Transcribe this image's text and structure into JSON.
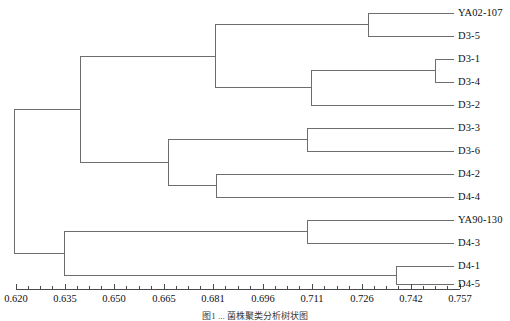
{
  "figure": {
    "type": "dendrogram",
    "caption": "图1 ... 菌株聚类分析树状图",
    "line_color": "#6d6d6d",
    "text_color": "#111111",
    "background": "#ffffff"
  },
  "axis": {
    "orientation": "horizontal",
    "label": "",
    "range": [
      0.62,
      0.757
    ],
    "pixel_range": [
      16,
      460
    ],
    "tick_labels": [
      "0.620",
      "0.635",
      "0.650",
      "0.665",
      "0.681",
      "0.696",
      "0.711",
      "0.726",
      "0.742",
      "0.757"
    ],
    "tick_values": [
      0.62,
      0.635,
      0.65,
      0.665,
      0.681,
      0.696,
      0.711,
      0.726,
      0.742,
      0.757
    ],
    "tick_x": [
      16,
      65,
      114,
      164,
      213,
      263,
      312,
      362,
      411,
      460
    ],
    "minor_ticks_between": 3,
    "baseline_y": 289
  },
  "leaves": [
    {
      "id": "YA02-107",
      "label": "YA02-107",
      "y": 13,
      "tip_x": 454
    },
    {
      "id": "D3-5",
      "label": "D3-5",
      "y": 36,
      "tip_x": 454
    },
    {
      "id": "D3-1",
      "label": "D3-1",
      "y": 59,
      "tip_x": 454
    },
    {
      "id": "D3-4",
      "label": "D3-4",
      "y": 82,
      "tip_x": 454
    },
    {
      "id": "D3-2",
      "label": "D3-2",
      "y": 105,
      "tip_x": 454
    },
    {
      "id": "D3-3",
      "label": "D3-3",
      "y": 128,
      "tip_x": 454
    },
    {
      "id": "D3-6",
      "label": "D3-6",
      "y": 151,
      "tip_x": 454
    },
    {
      "id": "D4-2",
      "label": "D4-2",
      "y": 174,
      "tip_x": 454
    },
    {
      "id": "D4-4",
      "label": "D4-4",
      "y": 197,
      "tip_x": 454
    },
    {
      "id": "YA90-130",
      "label": "YA90-130",
      "y": 220,
      "tip_x": 454
    },
    {
      "id": "D4-3",
      "label": "D4-3",
      "y": 243,
      "tip_x": 454
    },
    {
      "id": "D4-1",
      "label": "D4-1",
      "y": 266,
      "tip_x": 454
    },
    {
      "id": "D4-5",
      "label": "D4-5",
      "y": 284,
      "tip_x": 454
    }
  ],
  "nodes": [
    {
      "id": "n1",
      "name": "YA02-107 + D3-5",
      "x": 368,
      "y1": 13,
      "y2": 36,
      "y": 24.5
    },
    {
      "id": "n2",
      "name": "D3-1 + D3-4",
      "x": 435,
      "y1": 59,
      "y2": 82,
      "y": 70.5
    },
    {
      "id": "n3",
      "name": "(D3-1,D3-4) + D3-2",
      "x": 311,
      "y1": 70.5,
      "y2": 105,
      "y": 87.75
    },
    {
      "id": "n4",
      "name": "top cluster",
      "x": 215,
      "y1": 24.5,
      "y2": 87.75,
      "y": 56.1
    },
    {
      "id": "n5",
      "name": "D3-3 + D3-6",
      "x": 307,
      "y1": 128,
      "y2": 151,
      "y": 139.5
    },
    {
      "id": "n6",
      "name": "D4-2 + D4-4",
      "x": 216,
      "y1": 174,
      "y2": 197,
      "y": 185.5
    },
    {
      "id": "n7",
      "name": "(D3-3,D3-6) + (D4-2,D4-4)",
      "x": 168,
      "y1": 139.5,
      "y2": 185.5,
      "y": 162.5
    },
    {
      "id": "n8",
      "name": "upper clade",
      "x": 80,
      "y1": 56.1,
      "y2": 162.5,
      "y": 109.3
    },
    {
      "id": "n9",
      "name": "YA90-130 + D4-3",
      "x": 307,
      "y1": 220,
      "y2": 243,
      "y": 231.5
    },
    {
      "id": "n10",
      "name": "D4-1 + D4-5",
      "x": 396,
      "y1": 266,
      "y2": 284,
      "y": 275
    },
    {
      "id": "n11",
      "name": "lower clade",
      "x": 64,
      "y1": 231.5,
      "y2": 275,
      "y": 253.25
    },
    {
      "id": "n12",
      "name": "root",
      "x": 14,
      "y1": 109.3,
      "y2": 253.25,
      "y": 181.3
    }
  ]
}
